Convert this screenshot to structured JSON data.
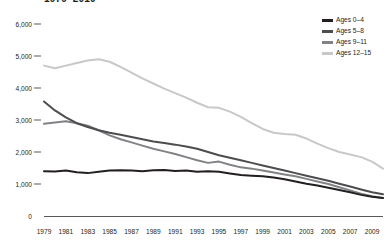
{
  "chart_data": {
    "type": "line",
    "title": "1979–2010",
    "xlabel": "",
    "ylabel": "",
    "xlim": [
      1979,
      2010
    ],
    "ylim": [
      0,
      6000
    ],
    "grid": false,
    "legend_position": "top-right",
    "ytick_labels": [
      "6,000",
      "5,000",
      "4,000",
      "3,000",
      "2,000",
      "1,000",
      "0"
    ],
    "ytick_values": [
      6000,
      5000,
      4000,
      3000,
      2000,
      1000,
      0
    ],
    "xtick_labels": [
      "1979",
      "1981",
      "1983",
      "1985",
      "1987",
      "1989",
      "1991",
      "1993",
      "1995",
      "1997",
      "1999",
      "2001",
      "2003",
      "2005",
      "2007",
      "2009"
    ],
    "xtick_values": [
      1979,
      1981,
      1983,
      1985,
      1987,
      1989,
      1991,
      1993,
      1995,
      1997,
      1999,
      2001,
      2003,
      2005,
      2007,
      2009
    ],
    "x": [
      1979,
      1980,
      1981,
      1982,
      1983,
      1984,
      1985,
      1986,
      1987,
      1988,
      1989,
      1990,
      1991,
      1992,
      1993,
      1994,
      1995,
      1996,
      1997,
      1998,
      1999,
      2000,
      2001,
      2002,
      2003,
      2004,
      2005,
      2006,
      2007,
      2008,
      2009,
      2010
    ],
    "series": [
      {
        "name": "Ages 0–4",
        "color": "#231f20",
        "values": [
          1400,
          1390,
          1420,
          1370,
          1340,
          1380,
          1420,
          1430,
          1420,
          1400,
          1430,
          1440,
          1410,
          1420,
          1380,
          1400,
          1380,
          1330,
          1280,
          1260,
          1240,
          1200,
          1150,
          1080,
          1010,
          950,
          880,
          810,
          740,
          660,
          600,
          560
        ]
      },
      {
        "name": "Ages 5–8",
        "color": "#4d4d4f",
        "values": [
          3580,
          3300,
          3080,
          2900,
          2780,
          2680,
          2600,
          2540,
          2470,
          2400,
          2330,
          2280,
          2230,
          2170,
          2100,
          2000,
          1900,
          1820,
          1740,
          1660,
          1580,
          1500,
          1420,
          1340,
          1260,
          1180,
          1100,
          1010,
          920,
          830,
          740,
          680
        ]
      },
      {
        "name": "Ages 9–11",
        "color": "#808285",
        "values": [
          2880,
          2920,
          2960,
          2900,
          2820,
          2680,
          2520,
          2400,
          2300,
          2200,
          2100,
          2020,
          1940,
          1840,
          1740,
          1660,
          1700,
          1600,
          1520,
          1480,
          1420,
          1360,
          1300,
          1240,
          1160,
          1080,
          1000,
          900,
          800,
          700,
          620,
          560
        ]
      },
      {
        "name": "Ages 12–15",
        "color": "#c7c8ca",
        "values": [
          4700,
          4620,
          4700,
          4780,
          4860,
          4900,
          4820,
          4660,
          4480,
          4300,
          4140,
          3980,
          3840,
          3700,
          3540,
          3400,
          3380,
          3260,
          3100,
          2900,
          2720,
          2600,
          2560,
          2540,
          2420,
          2260,
          2120,
          2000,
          1920,
          1840,
          1700,
          1480
        ]
      }
    ]
  }
}
